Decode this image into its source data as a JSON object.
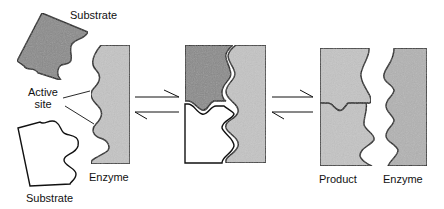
{
  "diagram": {
    "type": "enzyme-substrate lock-and-key",
    "labels": {
      "substrate_top": "Substrate",
      "active_site_line1": "Active",
      "active_site_line2": "site",
      "enzyme_left": "Enzyme",
      "substrate_bottom": "Substrate",
      "product": "Product",
      "enzyme_right": "Enzyme"
    },
    "stages": [
      {
        "name": "separate",
        "elements": [
          "Substrate",
          "Substrate",
          "Enzyme"
        ]
      },
      {
        "name": "enzyme-substrate complex",
        "elements": [
          "Substrate",
          "Substrate",
          "Enzyme"
        ]
      },
      {
        "name": "released",
        "elements": [
          "Product",
          "Enzyme"
        ]
      }
    ],
    "arrows": [
      {
        "type": "reversible",
        "between": [
          "separate",
          "complex"
        ]
      },
      {
        "type": "reversible",
        "between": [
          "complex",
          "released"
        ]
      }
    ],
    "colors": {
      "dark_fill": "#8a8a8a",
      "light_fill": "#c4c4c4",
      "white_fill": "#ffffff",
      "stroke": "#111111"
    }
  }
}
